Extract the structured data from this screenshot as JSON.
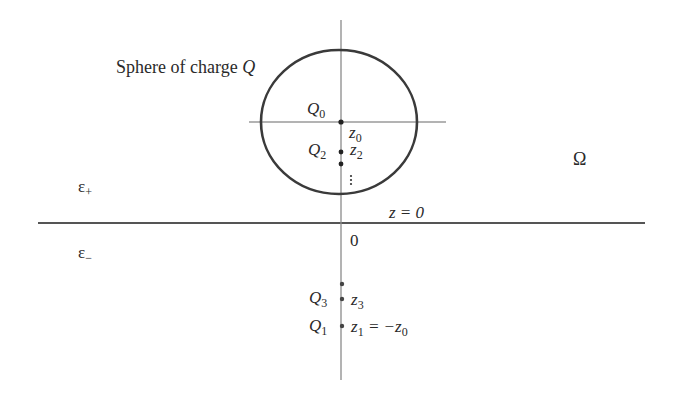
{
  "figure": {
    "title_label": "Sphere of charge",
    "title_var": "Q",
    "domain_label": "Ω",
    "eps_plus": "ε",
    "eps_plus_sub": "+",
    "eps_minus": "ε",
    "eps_minus_sub": "−",
    "interface_label": "z = 0",
    "origin_label": "0",
    "charges": [
      {
        "name": "Q",
        "sub": "0",
        "pos_name": "z",
        "pos_sub": "0",
        "pos_extra": ""
      },
      {
        "name": "Q",
        "sub": "2",
        "pos_name": "z",
        "pos_sub": "2",
        "pos_extra": ""
      },
      {
        "name": "Q",
        "sub": "3",
        "pos_name": "z",
        "pos_sub": "3",
        "pos_extra": ""
      },
      {
        "name": "Q",
        "sub": "1",
        "pos_name": "z",
        "pos_sub": "1",
        "pos_extra": " = −z",
        "pos_extra_sub": "0"
      }
    ],
    "ellipsis": "⋮",
    "colors": {
      "circle": "#3a3a3a",
      "interface_line": "#555555",
      "axis_line": "#8a8a8a",
      "text": "#2a2a2a"
    }
  }
}
